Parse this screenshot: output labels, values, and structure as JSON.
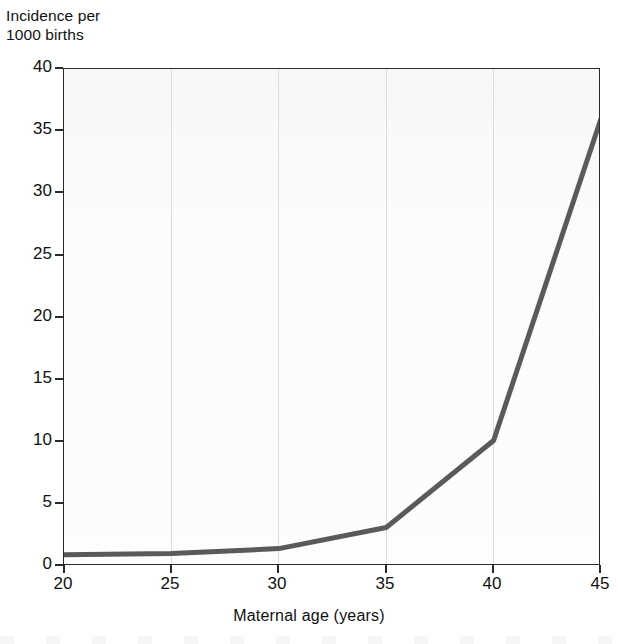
{
  "chart_data": {
    "type": "line",
    "title": "",
    "xlabel": "Maternal age (years)",
    "ylabel": "Incidence per\n1000 births",
    "x": [
      20,
      25,
      30,
      35,
      40,
      45
    ],
    "values": [
      0.9,
      1.0,
      1.4,
      3.1,
      10.1,
      36.0
    ],
    "series": [
      {
        "name": "Incidence",
        "values": [
          0.9,
          1.0,
          1.4,
          3.1,
          10.1,
          36.0
        ],
        "color": "#5a5a5a"
      }
    ],
    "xlim": [
      20,
      45
    ],
    "ylim": [
      0,
      40
    ],
    "xticks": [
      "20",
      "25",
      "30",
      "35",
      "40",
      "45"
    ],
    "yticks": [
      "0",
      "5",
      "10",
      "15",
      "20",
      "25",
      "30",
      "35",
      "40"
    ],
    "grid": "vertical",
    "legend": "none"
  },
  "axes": {
    "y_title": "Incidence per\n1000 births",
    "x_title": "Maternal age (years)",
    "y_tick_labels": [
      "40",
      "35",
      "30",
      "25",
      "20",
      "15",
      "10",
      "5",
      "0"
    ],
    "x_tick_labels": [
      "20",
      "25",
      "30",
      "35",
      "40",
      "45"
    ]
  },
  "style": {
    "line_color": "#5a5a5a",
    "frame_color": "#2a2a2a",
    "grid_color": "#dcdcdc",
    "plot_background": "#fbfbfb",
    "page_background": "#ffffff",
    "text_color": "#111111"
  }
}
